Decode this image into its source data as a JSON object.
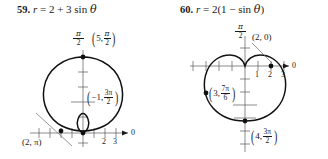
{
  "document": {
    "kind": "textbook-exercise-figures",
    "background": "#ffffff",
    "ink": "#1a1a1a"
  },
  "problems": [
    {
      "id": "59",
      "number": "59.",
      "equation_parts": {
        "r": "r",
        "equals": "=",
        "rhs": "2 + 3 sin",
        "theta": "θ"
      },
      "equation_plain": "r = 2 + 3 sin θ",
      "curve": "limaçon with inner loop",
      "axis_label_polar": "0",
      "axis_label_vertical_num": "π",
      "axis_label_vertical_den": "2",
      "x_ticks": [
        {
          "value": 2,
          "label": "2"
        },
        {
          "value": 3,
          "label": "3"
        }
      ],
      "points": [
        {
          "name": "top-point",
          "text_parts": {
            "r": "5,",
            "num": "π",
            "den": "2"
          },
          "text_plain": "(5, π/2)"
        },
        {
          "name": "inner-loop-point",
          "text_parts": {
            "r": "−1,",
            "num": "3π",
            "den": "2"
          },
          "text_plain": "(−1, 3π/2)"
        },
        {
          "name": "left-point",
          "text_plain": "(2, π)"
        }
      ]
    },
    {
      "id": "60",
      "number": "60.",
      "equation_parts": {
        "r": "r",
        "equals": "=",
        "rhs": "2(1 − sin",
        "theta": "θ",
        "close": ")"
      },
      "equation_plain": "r = 2(1 − sin θ)",
      "curve": "cardioid",
      "axis_label_polar": "0",
      "axis_label_vertical_num": "π",
      "axis_label_vertical_den": "2",
      "x_ticks": [
        {
          "value": 1,
          "label": "1"
        },
        {
          "value": 2,
          "label": "2"
        },
        {
          "value": 3,
          "label": "3"
        }
      ],
      "points": [
        {
          "name": "right-point",
          "text_plain": "(2, 0)"
        },
        {
          "name": "left-point",
          "text_parts": {
            "r": "3,",
            "num": "7π",
            "den": "6"
          },
          "text_plain": "(3, 7π/6)"
        },
        {
          "name": "bottom-point",
          "text_parts": {
            "r": "4,",
            "num": "3π",
            "den": "2"
          },
          "text_plain": "(4, 3π/2)"
        }
      ]
    }
  ]
}
